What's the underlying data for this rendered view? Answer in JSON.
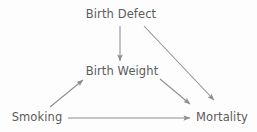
{
  "diagram": {
    "type": "causal-dag",
    "title": "",
    "background_color": "#fdfdfd",
    "text_color": "#5b5b5b",
    "edge_color": "#8d8d8d",
    "nodes": [
      {
        "id": "birth_defect",
        "label": "Birth Defect",
        "x": 121,
        "y": 15
      },
      {
        "id": "birth_weight",
        "label": "Birth Weight",
        "x": 122,
        "y": 72
      },
      {
        "id": "smoking",
        "label": "Smoking",
        "x": 37,
        "y": 118
      },
      {
        "id": "mortality",
        "label": "Mortality",
        "x": 222,
        "y": 118
      }
    ],
    "edges": [
      {
        "id": "birth_defect-to-birth_weight",
        "from": "Birth Defect",
        "to": "Birth Weight",
        "x1": 120,
        "y1": 26,
        "x2": 120,
        "y2": 61
      },
      {
        "id": "birth_defect-to-mortality",
        "from": "Birth Defect",
        "to": "Mortality",
        "x1": 144,
        "y1": 26,
        "x2": 214,
        "y2": 100
      },
      {
        "id": "birth_weight-to-mortality",
        "from": "Birth Weight",
        "to": "Mortality",
        "x1": 160,
        "y1": 79,
        "x2": 190,
        "y2": 104
      },
      {
        "id": "smoking-to-birth_weight",
        "from": "Smoking",
        "to": "Birth Weight",
        "x1": 50,
        "y1": 107,
        "x2": 83,
        "y2": 80
      },
      {
        "id": "smoking-to-mortality",
        "from": "Smoking",
        "to": "Mortality",
        "x1": 68,
        "y1": 118,
        "x2": 190,
        "y2": 118
      }
    ]
  }
}
